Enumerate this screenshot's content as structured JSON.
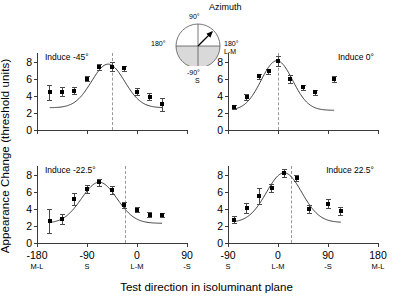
{
  "figure": {
    "y_axis_label": "Appearance Change (threshold units)",
    "x_axis_label": "Test direction in isoluminant plane"
  },
  "inset": {
    "title": "Azimuth",
    "top_label": "90°",
    "left_label": "180°",
    "right_label": "180°",
    "right_sub_label": "L-M",
    "bottom_label": "-90°",
    "bottom_sub_label": "S",
    "arrow_direction_deg": 45
  },
  "axes": {
    "y_ticks": [
      "0",
      "2",
      "4",
      "6",
      "8"
    ],
    "y_tick_values": [
      0,
      2,
      4,
      6,
      8
    ],
    "ylim": [
      0,
      9
    ],
    "left_x_ticks": [
      "-180",
      "-90",
      "0",
      "90"
    ],
    "left_x_sub": [
      "M-L",
      "S",
      "L-M",
      "-S"
    ],
    "left_x_values": [
      -180,
      -90,
      0,
      90
    ],
    "left_xlim": [
      -180,
      90
    ],
    "right_x_ticks": [
      "-90",
      "0",
      "90",
      "180"
    ],
    "right_x_sub": [
      "S",
      "L-M",
      "-S",
      "M-L"
    ],
    "right_x_values": [
      -90,
      0,
      90,
      180
    ],
    "right_xlim": [
      -90,
      180
    ]
  },
  "chart_data": {
    "type": "scatter",
    "title": "",
    "xlabel": "Test direction in isoluminant plane",
    "ylabel": "Appearance Change (threshold units)",
    "ylim": [
      0,
      9
    ],
    "grid": false,
    "legend": "none",
    "panels": [
      {
        "name": "induce-minus-45",
        "label": "Induce -45°",
        "position": "top-left",
        "xlim": [
          -180,
          90
        ],
        "peak_marker_x": -45,
        "x": [
          -157,
          -135,
          -113,
          -90,
          -68,
          -45,
          -23,
          0,
          23,
          45
        ],
        "y": [
          4.4,
          4.5,
          4.6,
          6.0,
          7.4,
          7.4,
          7.2,
          4.5,
          3.9,
          3.0
        ],
        "yerr": [
          0.85,
          0.5,
          0.45,
          0.3,
          0.35,
          0.5,
          0.3,
          0.4,
          0.45,
          0.75
        ],
        "curve": {
          "baseline": 2.6,
          "amplitude": 5.1,
          "center": -52,
          "width": 42
        }
      },
      {
        "name": "induce-0",
        "label": "Induce 0°",
        "position": "top-right",
        "xlim": [
          -90,
          180
        ],
        "peak_marker_x": 0,
        "x": [
          -79,
          -56,
          -34,
          -17,
          0,
          22,
          45,
          67,
          101
        ],
        "y": [
          2.65,
          3.85,
          6.3,
          6.85,
          8.05,
          6.0,
          5.0,
          4.4,
          5.95
        ],
        "yerr": [
          0.25,
          0.35,
          0.3,
          0.3,
          0.55,
          0.45,
          0.3,
          0.3,
          0.35
        ],
        "curve": {
          "baseline": 2.3,
          "amplitude": 5.8,
          "center": -2,
          "width": 40
        }
      },
      {
        "name": "induce-minus-22-5",
        "label": "Induce -22.5°",
        "position": "bottom-left",
        "xlim": [
          -180,
          90
        ],
        "peak_marker_x": -22.5,
        "x": [
          -157,
          -135,
          -113,
          -90,
          -68,
          -45,
          -23,
          0,
          23,
          45
        ],
        "y": [
          2.6,
          2.8,
          5.15,
          6.3,
          7.1,
          6.2,
          4.45,
          3.9,
          3.3,
          3.3
        ],
        "yerr": [
          1.4,
          0.55,
          0.7,
          0.45,
          0.4,
          0.5,
          0.35,
          0.3,
          0.3,
          0.25
        ]
      },
      {
        "name": "induce-22-5",
        "label": "Induce 22.5°",
        "position": "bottom-right",
        "xlim": [
          -90,
          180
        ],
        "peak_marker_x": 22.5,
        "x": [
          -79,
          -56,
          -34,
          -11,
          11,
          34,
          56,
          90,
          113
        ],
        "y": [
          2.7,
          4.1,
          5.5,
          6.4,
          8.2,
          7.6,
          3.95,
          4.6,
          3.75
        ],
        "yerr": [
          0.4,
          0.6,
          0.95,
          0.45,
          0.45,
          0.35,
          0.45,
          0.55,
          0.5
        ]
      }
    ]
  }
}
